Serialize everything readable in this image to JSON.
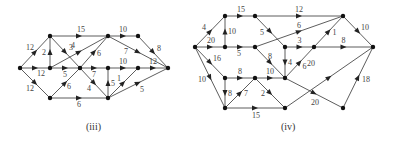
{
  "figures": [
    {
      "caption": "(iii)",
      "caption_pos": [
        86,
        130
      ],
      "nodes": {
        "A": [
          20,
          68
        ],
        "B": [
          50,
          36
        ],
        "C": [
          50,
          68
        ],
        "D": [
          80,
          68
        ],
        "E": [
          108,
          36
        ],
        "F": [
          138,
          36
        ],
        "G": [
          108,
          68
        ],
        "H": [
          138,
          68
        ],
        "I": [
          168,
          68
        ],
        "J": [
          50,
          98
        ],
        "K": [
          108,
          98
        ]
      },
      "edges": [
        {
          "from": "A",
          "to": "B",
          "w": "12",
          "lx": -9,
          "ly": -2
        },
        {
          "from": "A",
          "to": "C",
          "w": "12",
          "lx": 2,
          "ly": 8
        },
        {
          "from": "A",
          "to": "J",
          "w": "12",
          "lx": -9,
          "ly": 8
        },
        {
          "from": "B",
          "to": "E",
          "w": "15",
          "lx": -2,
          "ly": -4
        },
        {
          "from": "B",
          "to": "D",
          "w": "3",
          "lx": 4,
          "ly": -2
        },
        {
          "from": "C",
          "to": "B",
          "w": "2",
          "lx": -8,
          "ly": 3
        },
        {
          "from": "C",
          "to": "E",
          "w": "4",
          "lx": -8,
          "ly": -4
        },
        {
          "from": "C",
          "to": "D",
          "w": "5",
          "lx": -2,
          "ly": 9
        },
        {
          "from": "D",
          "to": "E",
          "w": "6",
          "lx": 3,
          "ly": 4
        },
        {
          "from": "D",
          "to": "G",
          "w": "7",
          "lx": -2,
          "ly": 9
        },
        {
          "from": "D",
          "to": "K",
          "w": "4",
          "lx": -7,
          "ly": 8
        },
        {
          "from": "J",
          "to": "D",
          "w": "6",
          "lx": 2,
          "ly": 6
        },
        {
          "from": "J",
          "to": "K",
          "w": "6",
          "lx": -2,
          "ly": 9
        },
        {
          "from": "E",
          "to": "F",
          "w": "10",
          "lx": -4,
          "ly": -4
        },
        {
          "from": "E",
          "to": "I",
          "w": "7",
          "lx": -14,
          "ly": 2
        },
        {
          "from": "F",
          "to": "I",
          "w": "8",
          "lx": 4,
          "ly": -1
        },
        {
          "from": "G",
          "to": "H",
          "w": "10",
          "lx": -4,
          "ly": -4
        },
        {
          "from": "H",
          "to": "I",
          "w": "12",
          "lx": -4,
          "ly": -4
        },
        {
          "from": "K",
          "to": "G",
          "w": "5",
          "lx": 3,
          "ly": 3
        },
        {
          "from": "K",
          "to": "H",
          "w": "1",
          "lx": -6,
          "ly": -2
        },
        {
          "from": "K",
          "to": "I",
          "w": "5",
          "lx": 2,
          "ly": 9
        }
      ]
    },
    {
      "caption": "(iv)",
      "caption_pos": [
        281,
        130
      ],
      "nodes": {
        "S": [
          195,
          47
        ],
        "a": [
          225,
          16
        ],
        "b": [
          255,
          16
        ],
        "c": [
          225,
          47
        ],
        "d": [
          255,
          47
        ],
        "e": [
          343,
          16
        ],
        "f": [
          285,
          47
        ],
        "g": [
          314,
          47
        ],
        "T": [
          373,
          47
        ],
        "h": [
          225,
          78
        ],
        "i": [
          255,
          78
        ],
        "j": [
          285,
          78
        ],
        "k": [
          225,
          108
        ],
        "l": [
          285,
          108
        ],
        "m": [
          343,
          108
        ]
      },
      "edges": [
        {
          "from": "S",
          "to": "a",
          "w": "4",
          "lx": -8,
          "ly": -2
        },
        {
          "from": "S",
          "to": "c",
          "w": "20",
          "lx": -3,
          "ly": -4
        },
        {
          "from": "S",
          "to": "h",
          "w": "16",
          "lx": 3,
          "ly": -2
        },
        {
          "from": "S",
          "to": "k",
          "w": "10",
          "lx": -12,
          "ly": 4
        },
        {
          "from": "a",
          "to": "b",
          "w": "15",
          "lx": -3,
          "ly": -4
        },
        {
          "from": "c",
          "to": "a",
          "w": "10",
          "lx": 3,
          "ly": 2
        },
        {
          "from": "b",
          "to": "e",
          "w": "12",
          "lx": -4,
          "ly": -4
        },
        {
          "from": "b",
          "to": "f",
          "w": "5",
          "lx": -10,
          "ly": 3
        },
        {
          "from": "c",
          "to": "d",
          "w": "5",
          "lx": -3,
          "ly": 9
        },
        {
          "from": "d",
          "to": "e",
          "w": "6",
          "lx": -2,
          "ly": -4
        },
        {
          "from": "d",
          "to": "j",
          "w": "8",
          "lx": -2,
          "ly": -4
        },
        {
          "from": "f",
          "to": "g",
          "w": "3",
          "lx": -2,
          "ly": -4
        },
        {
          "from": "f",
          "to": "j",
          "w": "4",
          "lx": 3,
          "ly": 2
        },
        {
          "from": "j",
          "to": "g",
          "w": "6",
          "lx": 3,
          "ly": 6
        },
        {
          "from": "g",
          "to": "e",
          "w": "1",
          "lx": 4,
          "ly": 3
        },
        {
          "from": "g",
          "to": "T",
          "w": "8",
          "lx": -2,
          "ly": -4
        },
        {
          "from": "e",
          "to": "T",
          "w": "10",
          "lx": 3,
          "ly": -2
        },
        {
          "from": "h",
          "to": "i",
          "w": "8",
          "lx": -2,
          "ly": -4
        },
        {
          "from": "h",
          "to": "k",
          "w": "8",
          "lx": 3,
          "ly": 3
        },
        {
          "from": "k",
          "to": "i",
          "w": "7",
          "lx": 4,
          "ly": 3
        },
        {
          "from": "i",
          "to": "j",
          "w": "10",
          "lx": -4,
          "ly": -4
        },
        {
          "from": "i",
          "to": "l",
          "w": "2",
          "lx": -9,
          "ly": 3
        },
        {
          "from": "k",
          "to": "l",
          "w": "15",
          "lx": -3,
          "ly": 10
        },
        {
          "from": "l",
          "to": "T",
          "w": "20",
          "lx": -22,
          "ly": -12
        },
        {
          "from": "j",
          "to": "m",
          "w": "20",
          "lx": -3,
          "ly": 12
        },
        {
          "from": "m",
          "to": "T",
          "w": "18",
          "lx": 4,
          "ly": 4
        }
      ]
    }
  ]
}
